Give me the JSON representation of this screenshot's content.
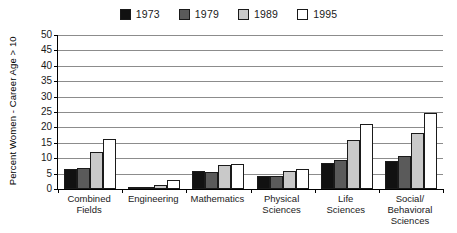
{
  "chart_data": {
    "type": "bar",
    "title": "",
    "xlabel": "",
    "ylabel": "Percent Women - Career Age > 10",
    "ylim": [
      0,
      50
    ],
    "ytick_labels": [
      "50",
      "45",
      "40",
      "35",
      "30",
      "25",
      "20",
      "15",
      "10",
      "5",
      "0"
    ],
    "ytick_values": [
      50,
      45,
      40,
      35,
      30,
      25,
      20,
      15,
      10,
      5,
      0
    ],
    "grid": true,
    "grid_axis": "y",
    "legend_position": "top-center",
    "categories": [
      "Combined Fields",
      "Engineering",
      "Mathematics",
      "Physical Sciences",
      "Life Sciences",
      "Social/ Behavioral Sciences"
    ],
    "category_lines": [
      [
        "Combined",
        "Fields"
      ],
      [
        "Engineering"
      ],
      [
        "Mathematics"
      ],
      [
        "Physical",
        "Sciences"
      ],
      [
        "Life",
        "Sciences"
      ],
      [
        "Social/",
        "Behavioral",
        "Sciences"
      ]
    ],
    "series": [
      {
        "name": "1973",
        "color": "#111111",
        "values": [
          6.4,
          0.4,
          6.0,
          4.1,
          8.6,
          9.0
        ]
      },
      {
        "name": "1979",
        "color": "#5a5a5a",
        "values": [
          6.8,
          0.6,
          5.6,
          4.3,
          9.4,
          10.8
        ]
      },
      {
        "name": "1989",
        "color": "#c9c9c9",
        "values": [
          11.9,
          1.3,
          7.7,
          5.7,
          15.8,
          18.3
        ]
      },
      {
        "name": "1995",
        "color": "#ffffff",
        "values": [
          16.4,
          3.0,
          8.1,
          6.4,
          21.2,
          24.6
        ]
      }
    ]
  },
  "legend": {
    "items": [
      {
        "label": "1973",
        "color": "#111111"
      },
      {
        "label": "1979",
        "color": "#5a5a5a"
      },
      {
        "label": "1989",
        "color": "#c9c9c9"
      },
      {
        "label": "1995",
        "color": "#ffffff"
      }
    ]
  },
  "colors": {
    "axis": "#000000",
    "gridline": "#8c8c8c",
    "background": "#ffffff",
    "bar_outline": "#1a1a1a"
  }
}
